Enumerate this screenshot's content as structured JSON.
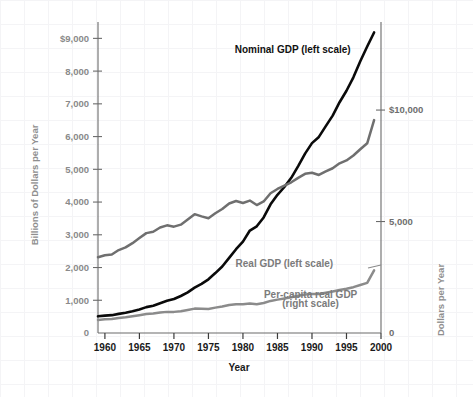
{
  "chart_data": {
    "type": "line",
    "title": "",
    "subtitle": "",
    "xlabel": "Year",
    "ylabel": "Billions of Dollars per Year",
    "ylabel_right": "Dollars per Year",
    "xlim": [
      1959,
      2000
    ],
    "ylim": [
      0,
      9500
    ],
    "ylim_right": [
      0,
      13950
    ],
    "grid": "faint background graph-paper grid only; no plot gridlines",
    "legend_position": "inline annotations next to each curve",
    "x_ticks": [
      1960,
      1965,
      1970,
      1975,
      1980,
      1985,
      1990,
      1995,
      2000
    ],
    "x_tick_labels": [
      "1960",
      "1965",
      "1970",
      "1975",
      "1980",
      "1985",
      "1990",
      "1995",
      "2000"
    ],
    "y_ticks_left": [
      0,
      1000,
      2000,
      3000,
      4000,
      5000,
      6000,
      7000,
      8000,
      9000
    ],
    "y_tick_labels_left": [
      "0",
      "1,000",
      "2,000",
      "3,000",
      "4,000",
      "5,000",
      "6,000",
      "7,000",
      "8,000",
      "$9,000"
    ],
    "y_ticks_right": [
      0,
      5000,
      10000
    ],
    "y_tick_labels_right": [
      "0",
      "5,000",
      "$10,000"
    ],
    "annotations": [
      {
        "text": "Nominal GDP (left scale)",
        "x": 1987.2,
        "y": 8550,
        "style": "dark"
      },
      {
        "text": "Real GDP (left scale)",
        "x": 1986.0,
        "y": 2030,
        "style": "grey"
      },
      {
        "text": "Per-capita real GDP",
        "x": 1989.8,
        "y": 1080,
        "style": "grey"
      },
      {
        "text": "(right scale)",
        "x": 1989.8,
        "y": 790,
        "style": "grey"
      }
    ],
    "x": [
      1959,
      1960,
      1961,
      1962,
      1963,
      1964,
      1965,
      1966,
      1967,
      1968,
      1969,
      1970,
      1971,
      1972,
      1973,
      1974,
      1975,
      1976,
      1977,
      1978,
      1979,
      1980,
      1981,
      1982,
      1983,
      1984,
      1985,
      1986,
      1987,
      1988,
      1989,
      1990,
      1991,
      1992,
      1993,
      1994,
      1995,
      1996,
      1997,
      1998,
      1999
    ],
    "series": [
      {
        "name": "Nominal GDP (left scale)",
        "scale": "left",
        "units": "Billions of Dollars per Year",
        "color": "#0a0a0a",
        "values": [
          510,
          530,
          545,
          585,
          620,
          665,
          720,
          790,
          835,
          910,
          985,
          1040,
          1130,
          1240,
          1385,
          1500,
          1640,
          1830,
          2030,
          2295,
          2560,
          2790,
          3130,
          3260,
          3530,
          3930,
          4220,
          4460,
          4740,
          5100,
          5480,
          5800,
          5990,
          6320,
          6640,
          7050,
          7400,
          7810,
          8300,
          8750,
          9180
        ]
      },
      {
        "name": "Real GDP (left scale)",
        "scale": "left",
        "units": "Billions of Dollars per Year (chained)",
        "color": "#8b8b8b",
        "values": [
          400,
          420,
          430,
          460,
          480,
          510,
          545,
          580,
          595,
          625,
          645,
          645,
          665,
          705,
          745,
          740,
          735,
          775,
          810,
          855,
          880,
          875,
          900,
          880,
          915,
          980,
          1020,
          1055,
          1090,
          1135,
          1175,
          1195,
          1190,
          1230,
          1265,
          1315,
          1350,
          1400,
          1465,
          1530,
          1915
        ]
      },
      {
        "name": "Per-capita real GDP (right scale)",
        "scale": "right",
        "units": "Dollars per Year",
        "color": "#6f6f6f",
        "values": [
          3400,
          3490,
          3520,
          3720,
          3840,
          4030,
          4260,
          4480,
          4540,
          4730,
          4830,
          4770,
          4860,
          5090,
          5330,
          5230,
          5150,
          5370,
          5560,
          5810,
          5920,
          5830,
          5940,
          5740,
          5900,
          6270,
          6460,
          6610,
          6760,
          6960,
          7140,
          7190,
          7090,
          7250,
          7390,
          7610,
          7740,
          7960,
          8240,
          8510,
          9550
        ]
      }
    ]
  }
}
